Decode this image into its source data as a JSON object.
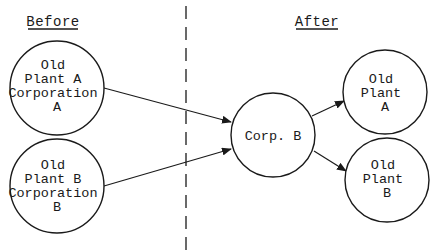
{
  "headers": {
    "before": "Before",
    "after": "After"
  },
  "nodes": {
    "old_plant_a_corp_a": {
      "lines": [
        "Old",
        "Plant A",
        "Corporation",
        "A"
      ]
    },
    "old_plant_b_corp_b": {
      "lines": [
        "Old",
        "Plant B",
        "Corporation",
        "B"
      ]
    },
    "corp_b": {
      "lines": [
        "Corp. B"
      ]
    },
    "old_plant_a": {
      "lines": [
        "Old",
        "Plant",
        "A"
      ]
    },
    "old_plant_b": {
      "lines": [
        "Old",
        "Plant",
        "B"
      ]
    }
  },
  "edges": [
    {
      "from": "old_plant_a_corp_a",
      "to": "corp_b"
    },
    {
      "from": "old_plant_b_corp_b",
      "to": "corp_b"
    },
    {
      "from": "corp_b",
      "to": "old_plant_a"
    },
    {
      "from": "corp_b",
      "to": "old_plant_b"
    }
  ],
  "colors": {
    "ink": "#1a1a1a",
    "background": "#ffffff"
  }
}
